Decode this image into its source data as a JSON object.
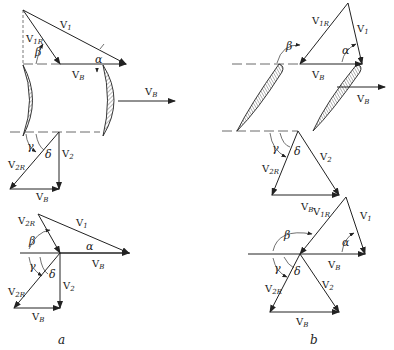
{
  "diagram": {
    "type": "velocity-triangles-turbine-blades",
    "panels": [
      {
        "id": "a",
        "caption": "a",
        "inlet_triangle": {
          "labels": {
            "v1": "V",
            "v1_sub": "1",
            "v1r": "V",
            "v1r_sub": "1R",
            "vb": "V",
            "vb_sub": "B",
            "alpha": "α",
            "beta": "β"
          }
        },
        "blade_row": {
          "vb": "V",
          "vb_sub": "B"
        },
        "outlet_triangle": {
          "labels": {
            "v2": "V",
            "v2_sub": "2",
            "v2r": "V",
            "v2r_sub": "2R",
            "vb": "V",
            "vb_sub": "B",
            "gamma": "γ",
            "delta": "δ"
          }
        },
        "combined_diagram": {
          "labels": {
            "v1": "V",
            "v1_sub": "1",
            "v2r": "V",
            "v2r_sub": "2R",
            "vb": "V",
            "vb_sub": "B",
            "vb2": "V",
            "vb2_sub": "B",
            "v2": "V",
            "v2_sub": "2",
            "alpha": "α",
            "beta": "β",
            "gamma": "γ",
            "delta": "δ"
          }
        }
      },
      {
        "id": "b",
        "caption": "b",
        "inlet_triangle": {
          "labels": {
            "v1": "V",
            "v1_sub": "1",
            "v1r": "V",
            "v1r_sub": "1R",
            "vb": "V",
            "vb_sub": "B",
            "alpha": "α",
            "beta": "β"
          }
        },
        "blade_row": {
          "vb": "V",
          "vb_sub": "B"
        },
        "outlet_triangle": {
          "labels": {
            "v2": "V",
            "v2_sub": "2",
            "v2r": "V",
            "v2r_sub": "2R",
            "vb": "V",
            "vb_sub": "B",
            "gamma": "γ",
            "delta": "δ"
          }
        },
        "combined_diagram": {
          "labels": {
            "v1": "V",
            "v1_sub": "1",
            "v1r": "V",
            "v1r_sub": "1R",
            "v2r": "V",
            "v2r_sub": "2R",
            "vb": "V",
            "vb_sub": "B",
            "vb2": "V",
            "vb2_sub": "B",
            "v2": "V",
            "v2_sub": "2",
            "alpha": "α",
            "beta": "β",
            "gamma": "γ",
            "delta": "δ"
          }
        }
      }
    ]
  }
}
